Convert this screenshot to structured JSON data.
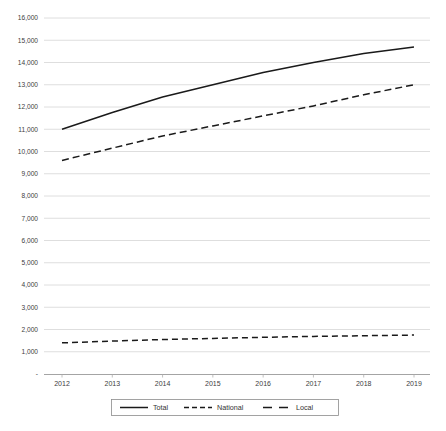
{
  "chart_data": {
    "type": "line",
    "title": "",
    "xlabel": "",
    "ylabel": "",
    "x": [
      2012,
      2013,
      2014,
      2015,
      2016,
      2017,
      2018,
      2019
    ],
    "categories": [
      "2012",
      "2013",
      "2014",
      "2015",
      "2016",
      "2017",
      "2018",
      "2019"
    ],
    "series": [
      {
        "name": "Total",
        "style": "solid",
        "values": [
          11000,
          11750,
          12450,
          13000,
          13550,
          14000,
          14400,
          14700
        ]
      },
      {
        "name": "National",
        "style": "dashed",
        "values": [
          9600,
          10150,
          10700,
          11150,
          11600,
          12050,
          12550,
          13000
        ]
      },
      {
        "name": "Local",
        "style": "long-dashed",
        "values": [
          1400,
          1480,
          1550,
          1600,
          1650,
          1690,
          1720,
          1750
        ]
      }
    ],
    "ylim": [
      0,
      16000
    ],
    "ytick_labels": [
      "-",
      "1,000",
      "2,000",
      "3,000",
      "4,000",
      "5,000",
      "6,000",
      "7,000",
      "8,000",
      "9,000",
      "10,000",
      "11,000",
      "12,000",
      "13,000",
      "14,000",
      "15,000",
      "16,000"
    ],
    "ytick_values": [
      0,
      1000,
      2000,
      3000,
      4000,
      5000,
      6000,
      7000,
      8000,
      9000,
      10000,
      11000,
      12000,
      13000,
      14000,
      15000,
      16000
    ],
    "grid": true,
    "legend_position": "bottom",
    "legend": [
      "Total",
      "National",
      "Local"
    ]
  },
  "caption": {
    "text": ""
  }
}
